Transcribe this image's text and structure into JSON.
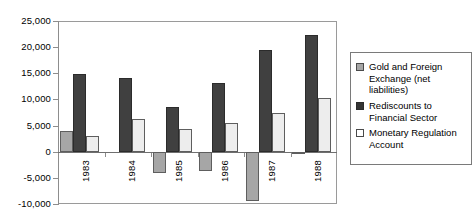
{
  "chart_data": {
    "type": "bar",
    "title": "",
    "subtitle": "",
    "xlabel": "",
    "ylabel": "",
    "categories": [
      "1983",
      "1984",
      "1985",
      "1986",
      "1987",
      "1988"
    ],
    "series": [
      {
        "name": "Gold and Foreign Exchange (net liabilities)",
        "color": "#a6a6a6",
        "values": [
          4000,
          0,
          -4000,
          -3600,
          -9400,
          -400
        ]
      },
      {
        "name": "Rediscounts to Financial Sector",
        "color": "#404040",
        "values": [
          14900,
          14100,
          8600,
          13100,
          19400,
          22400
        ]
      },
      {
        "name": "Monetary Regulation Account",
        "color": "#ededed",
        "values": [
          3100,
          6200,
          4300,
          5400,
          7400,
          10300
        ]
      }
    ],
    "ylim": [
      -10000,
      25000
    ],
    "ytick_values": [
      25000,
      20000,
      15000,
      10000,
      5000,
      0,
      -5000,
      -10000
    ],
    "ytick_labels": [
      "25,000",
      "20,000",
      "15,000",
      "10,000",
      "5,000",
      "0",
      "-5,000",
      "-10,000"
    ],
    "grid": false,
    "legend_position": "right",
    "legend_entries": [
      {
        "label": "Gold and Foreign Exchange (net liabilities)",
        "swatch": "gray"
      },
      {
        "label": "Rediscounts to Financial Sector",
        "swatch": "dark"
      },
      {
        "label": "Monetary Regulation Account",
        "swatch": "white"
      }
    ],
    "category_label_rotation": -90
  }
}
